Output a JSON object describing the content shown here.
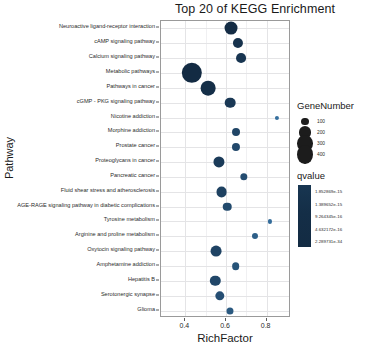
{
  "chart_data": {
    "type": "scatter",
    "title": "Top 20 of KEGG Enrichment",
    "xlabel": "RichFactor",
    "ylabel": "Pathway",
    "xlim": [
      0.28,
      0.92
    ],
    "xticks": [
      0.4,
      0.6,
      0.8
    ],
    "xtick_labels": [
      "0.4",
      "0.6",
      "0.8"
    ],
    "grid": true,
    "legend_position": "right",
    "categories": [
      "Neuroactive ligand-receptor interaction",
      "cAMP signaling pathway",
      "Calcium signaling pathway",
      "Metabolic pathways",
      "Pathways in cancer",
      "cGMP - PKG signaling pathway",
      "Nicotine addiction",
      "Morphine addiction",
      "Prostate cancer",
      "Proteoglycans in cancer",
      "Pancreatic cancer",
      "Fluid shear stress and atherosclerosis",
      "AGE-RAGE signaling pathway in diabetic complications",
      "Tyrosine metabolism",
      "Arginine and proline metabolism",
      "Oxytocin signaling pathway",
      "Amphetamine addiction",
      "Hepatitis B",
      "Serotonergic synapse",
      "Glioma"
    ],
    "points": [
      {
        "pathway": "Neuroactive ligand-receptor interaction",
        "rich_factor": 0.625,
        "gene_number": 210,
        "qvalue_rank": 0.02
      },
      {
        "pathway": "cAMP signaling pathway",
        "rich_factor": 0.658,
        "gene_number": 150,
        "qvalue_rank": 0.1
      },
      {
        "pathway": "Calcium signaling pathway",
        "rich_factor": 0.672,
        "gene_number": 145,
        "qvalue_rank": 0.14
      },
      {
        "pathway": "Metabolic pathways",
        "rich_factor": 0.432,
        "gene_number": 420,
        "qvalue_rank": 0.0
      },
      {
        "pathway": "Pathways in cancer",
        "rich_factor": 0.512,
        "gene_number": 255,
        "qvalue_rank": 0.05
      },
      {
        "pathway": "cGMP - PKG signaling pathway",
        "rich_factor": 0.622,
        "gene_number": 160,
        "qvalue_rank": 0.18
      },
      {
        "pathway": "Nicotine addiction",
        "rich_factor": 0.852,
        "gene_number": 55,
        "qvalue_rank": 0.92
      },
      {
        "pathway": "Morphine addiction",
        "rich_factor": 0.648,
        "gene_number": 110,
        "qvalue_rank": 0.35
      },
      {
        "pathway": "Prostate cancer",
        "rich_factor": 0.65,
        "gene_number": 112,
        "qvalue_rank": 0.4
      },
      {
        "pathway": "Proteoglycans in cancer",
        "rich_factor": 0.565,
        "gene_number": 170,
        "qvalue_rank": 0.22
      },
      {
        "pathway": "Pancreatic cancer",
        "rich_factor": 0.688,
        "gene_number": 100,
        "qvalue_rank": 0.45
      },
      {
        "pathway": "Fluid shear stress and atherosclerosis",
        "rich_factor": 0.578,
        "gene_number": 165,
        "qvalue_rank": 0.3
      },
      {
        "pathway": "AGE-RAGE signaling pathway in diabetic complications",
        "rich_factor": 0.605,
        "gene_number": 120,
        "qvalue_rank": 0.42
      },
      {
        "pathway": "Tyrosine metabolism",
        "rich_factor": 0.818,
        "gene_number": 55,
        "qvalue_rank": 0.88
      },
      {
        "pathway": "Arginine and proline metabolism",
        "rich_factor": 0.742,
        "gene_number": 80,
        "qvalue_rank": 0.7
      },
      {
        "pathway": "Oxytocin signaling pathway",
        "rich_factor": 0.552,
        "gene_number": 165,
        "qvalue_rank": 0.33
      },
      {
        "pathway": "Amphetamine addiction",
        "rich_factor": 0.648,
        "gene_number": 105,
        "qvalue_rank": 0.55
      },
      {
        "pathway": "Hepatitis B",
        "rich_factor": 0.548,
        "gene_number": 155,
        "qvalue_rank": 0.38
      },
      {
        "pathway": "Serotonergic synapse",
        "rich_factor": 0.568,
        "gene_number": 135,
        "qvalue_rank": 0.48
      },
      {
        "pathway": "Glioma",
        "rich_factor": 0.618,
        "gene_number": 95,
        "qvalue_rank": 0.62
      }
    ],
    "size_legend": {
      "title": "GeneNumber",
      "breaks": [
        100,
        200,
        300,
        400
      ],
      "labels": [
        "100",
        "200",
        "300",
        "400"
      ]
    },
    "color_legend": {
      "title": "qvalue",
      "labels": [
        "1.852869e-15",
        "1.389652e-15",
        "9.264345e-16",
        "4.632172e-16",
        "2.289731e-34"
      ],
      "high_color": "#132b43",
      "low_color": "#56b1f7"
    }
  }
}
